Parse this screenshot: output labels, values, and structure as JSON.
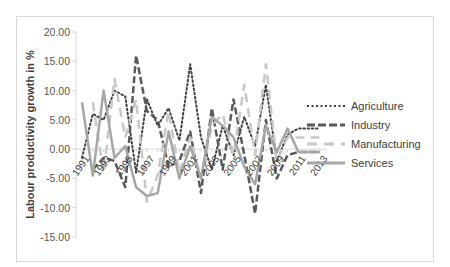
{
  "chart_data": {
    "type": "line",
    "title": "",
    "xlabel": "",
    "ylabel": "Labour productivity growth in %",
    "ylim": [
      -15,
      20
    ],
    "yticks": [
      "20.00",
      "15.00",
      "10.00",
      "5.00",
      "0.00",
      "-5.00",
      "-10.00",
      "-15.00"
    ],
    "x": [
      1991,
      1992,
      1993,
      1994,
      1995,
      1996,
      1997,
      1998,
      1999,
      2000,
      2001,
      2002,
      2003,
      2004,
      2005,
      2006,
      2007,
      2008,
      2009,
      2010,
      2011,
      2012,
      2013
    ],
    "xtick_labels": [
      "1991",
      "1993",
      "1995",
      "1997",
      "1999",
      "2001",
      "2003",
      "2005",
      "2007",
      "2009",
      "2011",
      "2013"
    ],
    "grid": false,
    "legend_position": "right",
    "series": [
      {
        "name": "Agriculture",
        "style": "dotted",
        "color": "#404040",
        "values": [
          -1.5,
          6.0,
          5.0,
          10.0,
          9.0,
          -4.0,
          8.5,
          4.0,
          7.0,
          1.5,
          14.5,
          2.0,
          -3.5,
          4.0,
          -1.0,
          5.5,
          0.5,
          11.0,
          -2.0,
          2.5,
          3.5,
          3.5,
          3.5
        ]
      },
      {
        "name": "Industry",
        "style": "dashed",
        "color": "#595959",
        "values": [
          null,
          -3.5,
          -1.5,
          -2.0,
          -6.5,
          16.0,
          6.5,
          5.0,
          -3.0,
          -2.0,
          3.0,
          -7.5,
          7.0,
          -3.5,
          8.5,
          -1.0,
          -11.0,
          5.0,
          -5.0,
          -1.0,
          -0.5,
          -0.5,
          -0.5
        ]
      },
      {
        "name": "Manufacturing",
        "style": "dashed",
        "color": "#c8c8c8",
        "values": [
          null,
          8.0,
          -4.0,
          12.0,
          2.0,
          8.5,
          -9.0,
          -4.5,
          6.5,
          -4.0,
          2.0,
          -5.0,
          4.0,
          6.0,
          -1.0,
          11.0,
          -1.0,
          14.5,
          -2.0,
          2.0,
          2.0,
          2.0,
          2.0
        ]
      },
      {
        "name": "Services",
        "style": "solid",
        "color": "#a6a6a6",
        "values": [
          8.0,
          -4.5,
          10.0,
          -1.5,
          0.5,
          -6.5,
          -8.0,
          -7.5,
          3.0,
          -5.0,
          0.5,
          -5.0,
          5.5,
          4.0,
          2.0,
          -3.0,
          -6.0,
          4.0,
          -0.5,
          3.5,
          -0.5,
          -0.5,
          -0.5
        ]
      }
    ]
  }
}
